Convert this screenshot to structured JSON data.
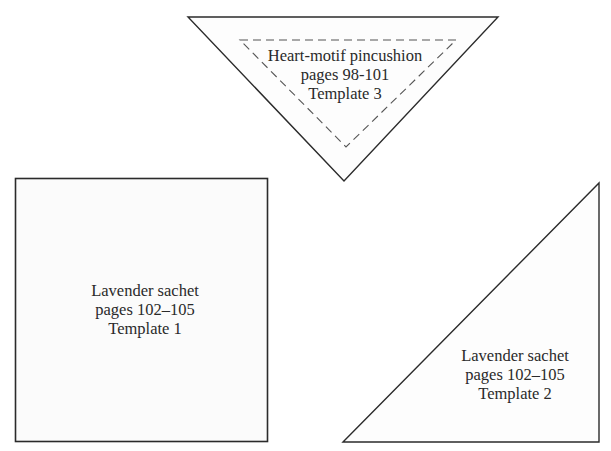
{
  "templates": [
    {
      "id": "template-3",
      "shape": "inverted-triangle",
      "title": "Heart-motif pincushion",
      "pages": "pages 98-101",
      "template": "Template 3",
      "has_dashed_seam_line": true
    },
    {
      "id": "template-1",
      "shape": "square",
      "title": "Lavender sachet",
      "pages": "pages 102–105",
      "template": "Template 1"
    },
    {
      "id": "template-2",
      "shape": "right-triangle",
      "title": "Lavender sachet",
      "pages": "pages 102–105",
      "template": "Template 2"
    }
  ],
  "colors": {
    "outline": "#2b2b2b",
    "dashed": "#555555",
    "fill": "#fdfdfd",
    "text": "#2a2a2a"
  }
}
